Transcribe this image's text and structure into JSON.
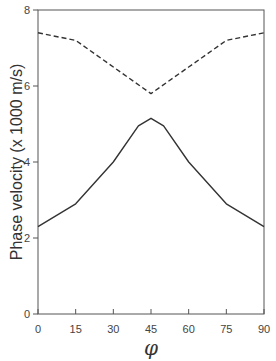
{
  "chart_data": {
    "type": "line",
    "title": "",
    "xlabel": "φ",
    "ylabel": "Phase velocity (x 1000 m/s)",
    "xlim": [
      0,
      90
    ],
    "ylim": [
      0,
      8
    ],
    "xticks": [
      0,
      15,
      30,
      45,
      60,
      75,
      90
    ],
    "yticks": [
      0,
      2,
      4,
      6,
      8
    ],
    "grid": false,
    "legend": null,
    "series": [
      {
        "name": "upper (dashed)",
        "style": "dashed",
        "color": "#333333",
        "x": [
          0,
          15,
          30,
          45,
          60,
          75,
          90
        ],
        "y": [
          7.4,
          7.2,
          6.5,
          5.8,
          6.5,
          7.2,
          7.4
        ]
      },
      {
        "name": "lower (solid)",
        "style": "solid",
        "color": "#333333",
        "x": [
          0,
          15,
          30,
          40,
          45,
          50,
          60,
          75,
          90
        ],
        "y": [
          2.3,
          2.9,
          4.0,
          4.95,
          5.15,
          4.95,
          4.0,
          2.9,
          2.3
        ]
      }
    ]
  }
}
